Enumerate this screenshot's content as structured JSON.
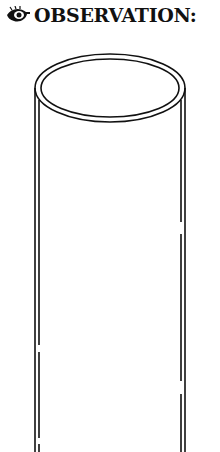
{
  "header": {
    "icon": "eye-icon",
    "title": "OBSERVATION:"
  },
  "illustration": {
    "subject": "tube-cylinder",
    "stroke_color": "#111111",
    "background": "#ffffff"
  }
}
